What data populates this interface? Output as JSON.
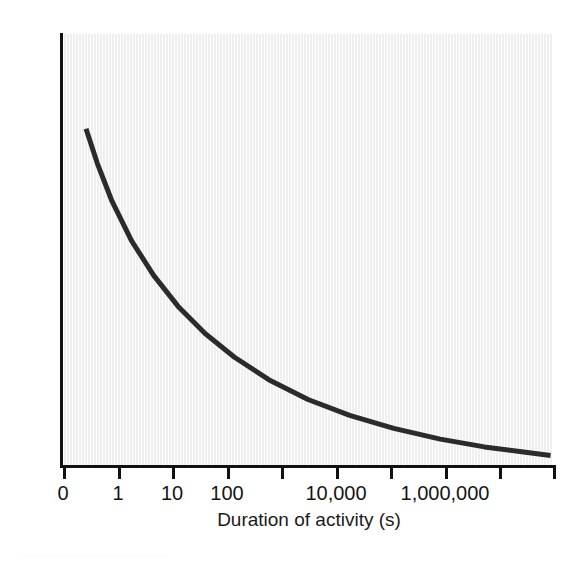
{
  "chart_data": {
    "type": "line",
    "title": "",
    "xlabel": "Duration of activity (s)",
    "ylabel": "Power output",
    "grid": false,
    "legend": false,
    "x_scale": "log-like (evenly spaced decade-style ticks)",
    "xlim": [
      0,
      10
    ],
    "ylim": [
      0,
      1
    ],
    "x_tick_positions": [
      0,
      1,
      2,
      3,
      4,
      5,
      6,
      7,
      8,
      9
    ],
    "x_tick_labels": [
      "0",
      "1",
      "10",
      "100",
      "",
      "10,000",
      "",
      "1,000,000",
      "",
      ""
    ],
    "y_tick_labels": [],
    "series": [
      {
        "name": "Power output",
        "color": "#2b2b2b",
        "line_width": 5,
        "points": [
          {
            "x": 0.47,
            "y": 0.78
          },
          {
            "x": 0.7,
            "y": 0.7
          },
          {
            "x": 1.0,
            "y": 0.612
          },
          {
            "x": 1.4,
            "y": 0.52
          },
          {
            "x": 1.85,
            "y": 0.44
          },
          {
            "x": 2.35,
            "y": 0.368
          },
          {
            "x": 2.9,
            "y": 0.305
          },
          {
            "x": 3.5,
            "y": 0.25
          },
          {
            "x": 4.2,
            "y": 0.198
          },
          {
            "x": 5.0,
            "y": 0.152
          },
          {
            "x": 5.85,
            "y": 0.115
          },
          {
            "x": 6.75,
            "y": 0.085
          },
          {
            "x": 7.7,
            "y": 0.06
          },
          {
            "x": 8.6,
            "y": 0.042
          },
          {
            "x": 9.4,
            "y": 0.03
          },
          {
            "x": 9.95,
            "y": 0.022
          }
        ]
      }
    ]
  },
  "axes": {
    "x": {
      "title": "Duration of activity (s)",
      "ticks": [
        {
          "label": "0",
          "px": 63
        },
        {
          "label": "1",
          "px": 118
        },
        {
          "label": "10",
          "px": 172
        },
        {
          "label": "100",
          "px": 227
        },
        {
          "label": "",
          "px": 281
        },
        {
          "label": "10,000",
          "px": 336
        },
        {
          "label": "",
          "px": 390
        },
        {
          "label": "1,000,000",
          "px": 445
        },
        {
          "label": "",
          "px": 499
        },
        {
          "label": "",
          "px": 553
        }
      ]
    },
    "y": {
      "title": "Power output",
      "ticks": []
    }
  },
  "style": {
    "panel_background": "#f3f3f3",
    "axis_color": "#111111",
    "curve_color": "#2b2b2b",
    "text_color": "#1b1b1b",
    "page_background": "#ffffff"
  }
}
